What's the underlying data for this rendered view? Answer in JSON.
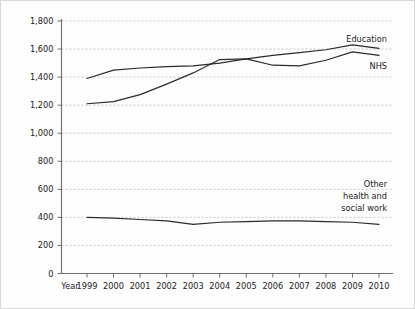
{
  "chart_data": {
    "type": "line",
    "title": "",
    "subtitle": "",
    "xlabel": "Year",
    "ylabel": "",
    "grid": "horizontal-dashed",
    "legend_position": "inline-right-of-series",
    "x": [
      1999,
      2000,
      2001,
      2002,
      2003,
      2004,
      2005,
      2006,
      2007,
      2008,
      2009,
      2010
    ],
    "xtick_labels": [
      "1999",
      "2000",
      "2001",
      "2002",
      "2003",
      "2004",
      "2005",
      "2006",
      "2007",
      "2008",
      "2009",
      "2010"
    ],
    "x_axis_label_left": "Year",
    "ylim": [
      0,
      1800
    ],
    "ytick_values": [
      0,
      200,
      400,
      600,
      800,
      1000,
      1200,
      1400,
      1600,
      1800
    ],
    "ytick_labels": [
      "0",
      "200",
      "400",
      "600",
      "800",
      "1,000",
      "1,200",
      "1,400",
      "1,600",
      "1,800"
    ],
    "series": [
      {
        "name": "Education",
        "label": "Education",
        "color": "#2b2b2b",
        "values": [
          1390,
          1450,
          1465,
          1475,
          1480,
          1500,
          1530,
          1555,
          1575,
          1595,
          1630,
          1605
        ]
      },
      {
        "name": "NHS",
        "label": "NHS",
        "color": "#2b2b2b",
        "values": [
          1210,
          1225,
          1275,
          1350,
          1430,
          1525,
          1530,
          1485,
          1480,
          1520,
          1580,
          1555
        ]
      },
      {
        "name": "Other health and social work",
        "label": "Other\nhealth and\nsocial work",
        "label_lines": [
          "Other",
          "health and",
          "social work"
        ],
        "color": "#2b2b2b",
        "values": [
          400,
          395,
          385,
          375,
          350,
          365,
          370,
          375,
          375,
          370,
          365,
          350
        ]
      }
    ]
  },
  "labels": {
    "education": "Education",
    "nhs": "NHS",
    "other_line1": "Other",
    "other_line2": "health and",
    "other_line3": "social work",
    "year": "Year"
  },
  "colors": {
    "line": "#2b2b2b",
    "grid": "#b9b9b9",
    "axis": "#6e6e6e",
    "background": "#fdfdfd",
    "text": "#1b1b1b"
  }
}
